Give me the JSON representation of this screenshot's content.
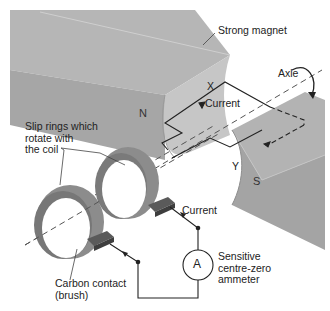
{
  "diagram": {
    "labels": {
      "magnet": "Strong magnet",
      "axle": "Axle",
      "north_pole": "N",
      "south_pole": "S",
      "coil_side_x": "X",
      "coil_side_y": "Y",
      "current_coil": "Current",
      "current_circuit": "Current",
      "slip_rings_line1": "Slip rings which",
      "slip_rings_line2": "rotate with",
      "slip_rings_line3": "the coil",
      "brush_line1": "Carbon contact",
      "brush_line2": "(brush)",
      "ammeter_symbol": "A",
      "ammeter_line1": "Sensitive",
      "ammeter_line2": "centre-zero",
      "ammeter_line3": "ammeter"
    },
    "colors": {
      "magnet_top": "#b4b4b4",
      "magnet_face": "#a8a8a8",
      "magnet_pole_face": "#c8c8c8",
      "ring": "#8e8e8e",
      "ring_dark": "#6a6a6a",
      "brush": "#555555",
      "wire": "#222222",
      "background": "#ffffff"
    }
  }
}
